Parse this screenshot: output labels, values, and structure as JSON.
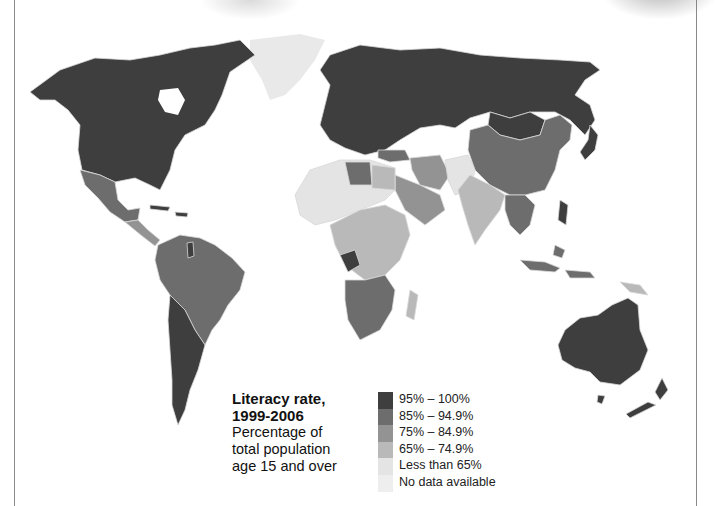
{
  "map": {
    "type": "choropleth-world",
    "subject": "Literacy rate",
    "colors": {
      "c95_100": "#3e3e3e",
      "c85_949": "#6d6d6d",
      "c75_849": "#939393",
      "c65_749": "#b9b9b9",
      "lt65": "#e4e4e4",
      "nodata": "#eeeeee",
      "border": "#d8d8d8"
    }
  },
  "legend": {
    "title_line1": "Literacy rate,",
    "title_line2": "1999-2006",
    "desc_line1": "Percentage of",
    "desc_line2": "total population",
    "desc_line3": "age 15 and over",
    "items": [
      {
        "label": "95% – 100%",
        "color": "#3e3e3e"
      },
      {
        "label": "85% – 94.9%",
        "color": "#6d6d6d"
      },
      {
        "label": "75% – 84.9%",
        "color": "#939393"
      },
      {
        "label": "65% – 74.9%",
        "color": "#b9b9b9"
      },
      {
        "label": "Less than 65%",
        "color": "#e4e4e4"
      },
      {
        "label": "No data available",
        "color": "#eeeeee"
      }
    ]
  }
}
